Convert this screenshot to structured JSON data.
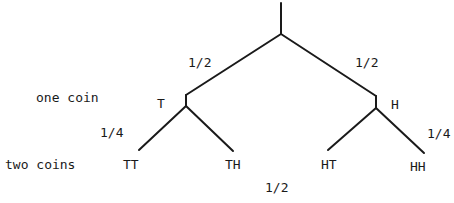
{
  "diagram": {
    "type": "probability-tree",
    "rows": {
      "one_coin": "one coin",
      "two_coins": "two coins"
    },
    "level1": {
      "left": {
        "outcome": "T",
        "probability": "1/2"
      },
      "right": {
        "outcome": "H",
        "probability": "1/2"
      }
    },
    "level2": {
      "leaves": [
        {
          "outcome": "TT"
        },
        {
          "outcome": "TH"
        },
        {
          "outcome": "HT"
        },
        {
          "outcome": "HH"
        }
      ],
      "prob_left": "1/4",
      "prob_right": "1/4",
      "prob_bottom": "1/2"
    },
    "colors": {
      "line": "#1a1a1a",
      "background": "#ffffff"
    }
  }
}
